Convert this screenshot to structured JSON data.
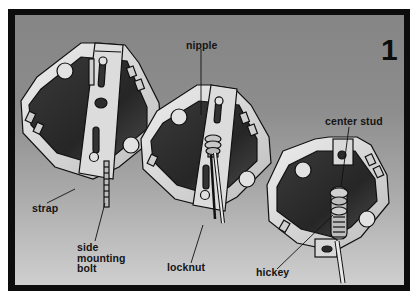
{
  "figure": {
    "step_number": "1",
    "labels": {
      "nipple": "nipple",
      "center_stud": "center stud",
      "strap": "strap",
      "side_mounting_bolt": [
        "side",
        "mounting",
        "bolt"
      ],
      "locknut": "locknut",
      "hickey": "hickey"
    },
    "components": [
      "octagonal box with strap",
      "octagonal box with nipple and locknut",
      "octagonal box with center stud and hickey"
    ],
    "colors": {
      "border": "#0d0d0d",
      "background_top": "#858585",
      "background_bottom": "#cfcfcf",
      "box_metal": "#d9d9d9",
      "box_interior": "#2e2e2e"
    }
  }
}
